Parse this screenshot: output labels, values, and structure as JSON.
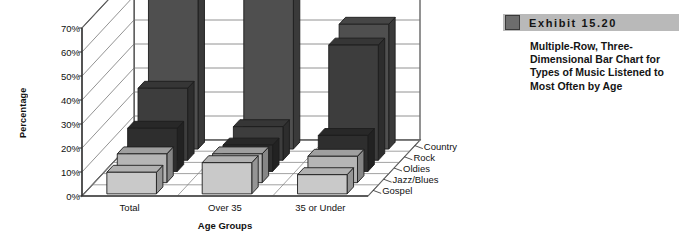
{
  "exhibit": {
    "number_label": "Exhibit  15.20",
    "caption": "Multiple-Row, Three-Dimensional Bar Chart for Types of Music Listened to Most Often by Age",
    "swatch_icon": "gray-square-icon",
    "header_color": "#b9b9b9",
    "swatch_color": "#6d6d6d"
  },
  "chart_data": {
    "type": "bar",
    "subtype": "3d-multiple-row",
    "title": "",
    "xlabel": "Age Groups",
    "ylabel": "Percentage",
    "categories": [
      "Total",
      "Over 35",
      "35 or Under"
    ],
    "ylim": [
      0,
      70
    ],
    "ytick_labels": [
      "0%",
      "10%",
      "20%",
      "30%",
      "40%",
      "50%",
      "60%",
      "70%"
    ],
    "ytick_values": [
      0,
      10,
      20,
      30,
      40,
      50,
      60,
      70
    ],
    "grid": true,
    "legend_position": "depth-axis-right",
    "series": [
      {
        "name": "Country",
        "values": [
          68,
          78,
          52
        ],
        "color": "#4f4f4f"
      },
      {
        "name": "Rock",
        "values": [
          30,
          14,
          48
        ],
        "color": "#3d3d3d"
      },
      {
        "name": "Oldies",
        "values": [
          18,
          11,
          15
        ],
        "color": "#2e2e2e"
      },
      {
        "name": "Jazz/Blues",
        "values": [
          12,
          12,
          11
        ],
        "color": "#b5b5b5"
      },
      {
        "name": "Gospel",
        "values": [
          9,
          13,
          8
        ],
        "color": "#c9c9c9"
      }
    ]
  }
}
